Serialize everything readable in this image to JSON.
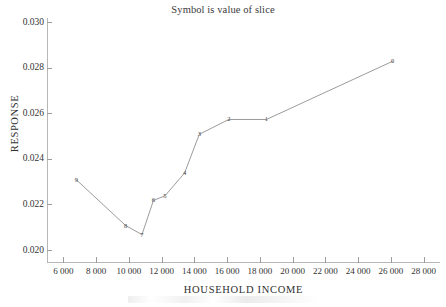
{
  "chart_data": {
    "type": "line",
    "title": "Symbol is value of slice",
    "xlabel": "HOUSEHOLD INCOME",
    "ylabel": "RESPONSE",
    "xlim": [
      5000,
      29000
    ],
    "ylim": [
      0.0195,
      0.0302
    ],
    "grid": false,
    "legend": "none",
    "xticks": [
      6000,
      8000,
      10000,
      12000,
      14000,
      16000,
      18000,
      20000,
      22000,
      24000,
      26000,
      28000
    ],
    "xtick_labels": [
      "6 000",
      "8 000",
      "10 000",
      "12 000",
      "14 000",
      "16 000",
      "18 000",
      "20 000",
      "22 000",
      "24 000",
      "26 000",
      "28 000"
    ],
    "yticks": [
      0.02,
      0.022,
      0.024,
      0.026,
      0.028,
      0.03
    ],
    "ytick_labels": [
      "0.020",
      "0.022",
      "0.024",
      "0.026",
      "0.028",
      "0.030"
    ],
    "marker_style": "digit-label",
    "line_color": "#707070",
    "points": [
      {
        "label": "9",
        "x": 6800,
        "y": 0.0231
      },
      {
        "label": "8",
        "x": 9800,
        "y": 0.0211
      },
      {
        "label": "7",
        "x": 10800,
        "y": 0.0207
      },
      {
        "label": "6",
        "x": 11500,
        "y": 0.0222
      },
      {
        "label": "5",
        "x": 12200,
        "y": 0.0224
      },
      {
        "label": "4",
        "x": 13400,
        "y": 0.0234
      },
      {
        "label": "3",
        "x": 14300,
        "y": 0.0251
      },
      {
        "label": "2",
        "x": 16100,
        "y": 0.02575
      },
      {
        "label": "1",
        "x": 18400,
        "y": 0.02575
      },
      {
        "label": "0",
        "x": 26100,
        "y": 0.0283
      }
    ]
  }
}
